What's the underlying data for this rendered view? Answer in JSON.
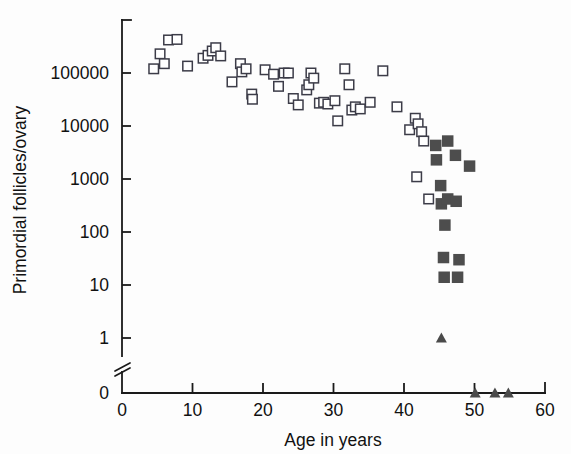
{
  "figure": {
    "background_color": "#fdfdfd",
    "width": 571,
    "height": 454
  },
  "axes": {
    "x_title": "Age in years",
    "y_title": "Primordial follicles/ovary",
    "x_ticks": [
      "0",
      "10",
      "20",
      "30",
      "40",
      "50",
      "60"
    ],
    "y_ticks": [
      "100000",
      "10000",
      "1000",
      "100",
      "10",
      "1",
      "0"
    ],
    "axis_color": "#1a1a1a",
    "has_axis_break": true,
    "break_position_label": "between 1 and 0"
  },
  "chart_data": {
    "type": "scatter",
    "title": "",
    "xlabel": "Age in years",
    "ylabel": "Primordial follicles/ovary",
    "xlim": [
      0,
      60
    ],
    "ylim": [
      1,
      1000000
    ],
    "yscale": "log",
    "ytick_values": [
      100000,
      10000,
      1000,
      100,
      10,
      1,
      0
    ],
    "xtick_values": [
      0,
      10,
      20,
      30,
      40,
      50,
      60
    ],
    "grid": false,
    "legend": "none",
    "axis_break": {
      "between": [
        1,
        0
      ],
      "note": "broken y-axis below 1 down to zero baseline"
    },
    "series": [
      {
        "name": "open-square",
        "marker": "open square",
        "color": "#ffffff",
        "edge_color": "#3c3c48",
        "points": [
          {
            "x": 4.5,
            "y": 120000
          },
          {
            "x": 5.4,
            "y": 230000
          },
          {
            "x": 6.0,
            "y": 150000
          },
          {
            "x": 6.6,
            "y": 420000
          },
          {
            "x": 7.8,
            "y": 430000
          },
          {
            "x": 9.3,
            "y": 135000
          },
          {
            "x": 11.5,
            "y": 190000
          },
          {
            "x": 12.2,
            "y": 215000
          },
          {
            "x": 12.8,
            "y": 260000
          },
          {
            "x": 13.3,
            "y": 300000
          },
          {
            "x": 14.0,
            "y": 210000
          },
          {
            "x": 15.6,
            "y": 68000
          },
          {
            "x": 16.8,
            "y": 150000
          },
          {
            "x": 17.0,
            "y": 105000
          },
          {
            "x": 17.6,
            "y": 120000
          },
          {
            "x": 18.4,
            "y": 40000
          },
          {
            "x": 18.5,
            "y": 32000
          },
          {
            "x": 20.3,
            "y": 115000
          },
          {
            "x": 21.5,
            "y": 95000
          },
          {
            "x": 22.2,
            "y": 56000
          },
          {
            "x": 23.0,
            "y": 100000
          },
          {
            "x": 23.6,
            "y": 100000
          },
          {
            "x": 24.3,
            "y": 33000
          },
          {
            "x": 25.0,
            "y": 25000
          },
          {
            "x": 26.2,
            "y": 48000
          },
          {
            "x": 26.5,
            "y": 60000
          },
          {
            "x": 26.8,
            "y": 100000
          },
          {
            "x": 27.2,
            "y": 80000
          },
          {
            "x": 28.0,
            "y": 27000
          },
          {
            "x": 28.6,
            "y": 28000
          },
          {
            "x": 29.2,
            "y": 26000
          },
          {
            "x": 30.2,
            "y": 30000
          },
          {
            "x": 30.6,
            "y": 12500
          },
          {
            "x": 31.6,
            "y": 120000
          },
          {
            "x": 32.2,
            "y": 60000
          },
          {
            "x": 32.6,
            "y": 20000
          },
          {
            "x": 33.1,
            "y": 23000
          },
          {
            "x": 33.8,
            "y": 21000
          },
          {
            "x": 35.2,
            "y": 28000
          },
          {
            "x": 37.0,
            "y": 110000
          },
          {
            "x": 39.0,
            "y": 23000
          },
          {
            "x": 40.8,
            "y": 8500
          },
          {
            "x": 41.6,
            "y": 14000
          },
          {
            "x": 42.0,
            "y": 11000
          },
          {
            "x": 42.5,
            "y": 7800
          },
          {
            "x": 42.8,
            "y": 5200
          },
          {
            "x": 41.8,
            "y": 1100
          },
          {
            "x": 43.5,
            "y": 420
          }
        ]
      },
      {
        "name": "filled-square",
        "marker": "filled square",
        "color": "#4d4d4d",
        "points": [
          {
            "x": 44.5,
            "y": 4300
          },
          {
            "x": 46.2,
            "y": 5200
          },
          {
            "x": 44.6,
            "y": 2300
          },
          {
            "x": 47.3,
            "y": 2800
          },
          {
            "x": 49.3,
            "y": 1750
          },
          {
            "x": 45.2,
            "y": 750
          },
          {
            "x": 45.3,
            "y": 340
          },
          {
            "x": 46.2,
            "y": 420
          },
          {
            "x": 47.4,
            "y": 380
          },
          {
            "x": 45.8,
            "y": 135
          },
          {
            "x": 45.6,
            "y": 33
          },
          {
            "x": 47.8,
            "y": 30
          },
          {
            "x": 45.7,
            "y": 14
          },
          {
            "x": 47.6,
            "y": 14
          }
        ]
      },
      {
        "name": "filled-triangle",
        "marker": "filled triangle",
        "color": "#4a4a4a",
        "points": [
          {
            "x": 45.3,
            "y": 1
          },
          {
            "x": 50.1,
            "y": 0
          },
          {
            "x": 52.9,
            "y": 0
          },
          {
            "x": 54.8,
            "y": 0
          }
        ]
      }
    ]
  }
}
